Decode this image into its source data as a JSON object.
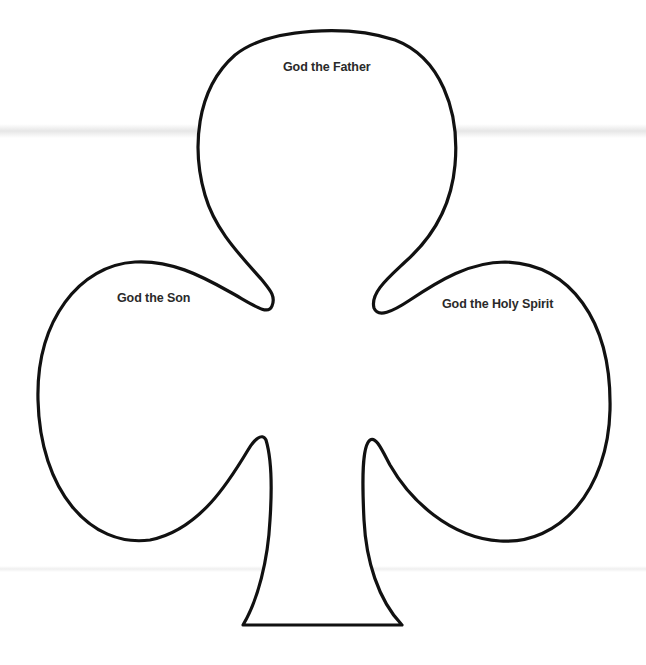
{
  "diagram": {
    "shape": "club-suit-outline",
    "stroke_color": "#111111",
    "fill_color": "#ffffff",
    "labels": {
      "top_lobe": "God the Father",
      "left_lobe": "God the Son",
      "right_lobe": "God the Holy Spirit"
    }
  }
}
